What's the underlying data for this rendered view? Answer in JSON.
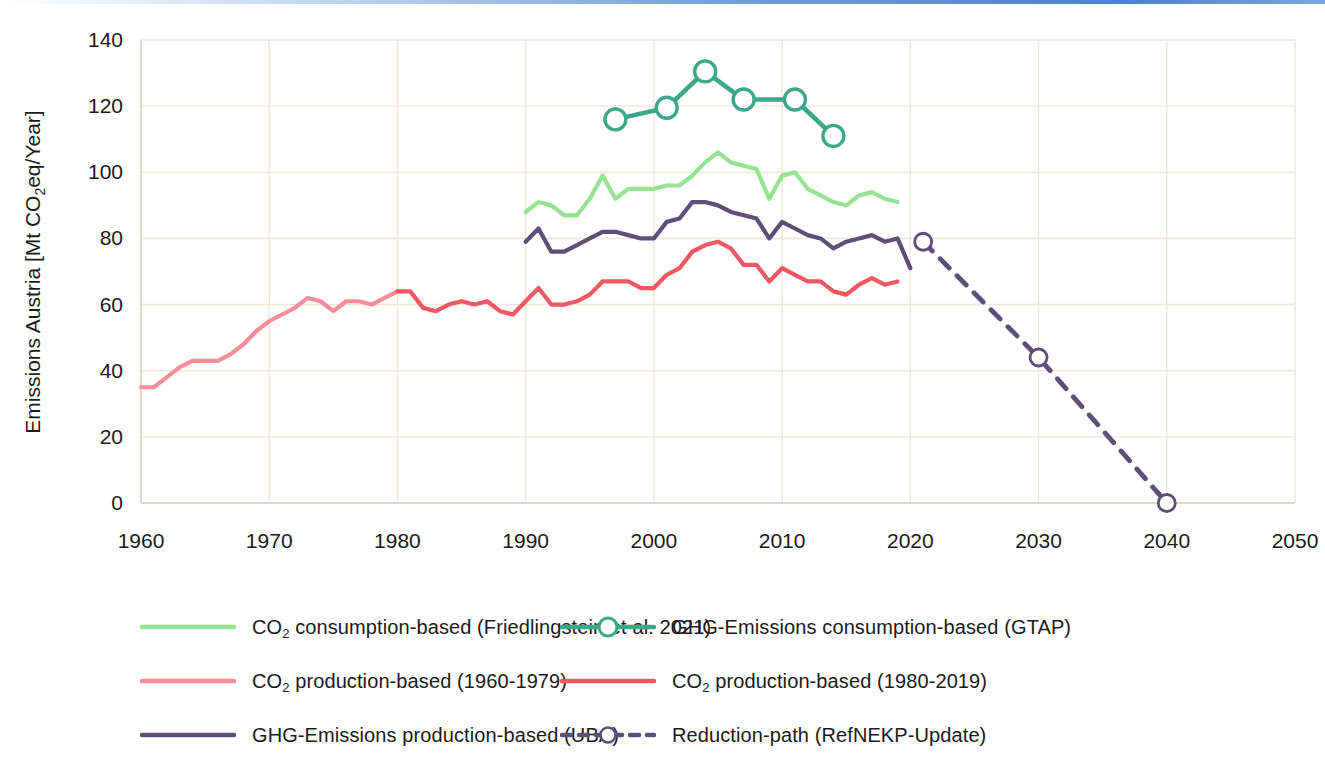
{
  "chart_data": {
    "type": "line",
    "title": "",
    "xlabel": "",
    "ylabel": "Emissions Austria [Mt CO2eq/Year]",
    "ylabel_parts": {
      "pre": "Emissions Austria [Mt CO",
      "sub": "2",
      "post": "eq/Year]"
    },
    "xlim": [
      1960,
      2050
    ],
    "ylim": [
      0,
      140
    ],
    "xticks": [
      "1960",
      "1970",
      "1980",
      "1990",
      "2000",
      "2010",
      "2020",
      "2030",
      "2040",
      "2050"
    ],
    "yticks": [
      "0",
      "20",
      "40",
      "60",
      "80",
      "100",
      "120",
      "140"
    ],
    "grid": true,
    "legend_position": "below-chart",
    "colors": {
      "co2_consumption_friedlingstein": "#95e391",
      "ghg_consumption_gtap": "#3ba888",
      "co2_production_1960_1979": "#f78d98",
      "co2_production_1980_2019": "#ef5761",
      "ghg_production_uba": "#5d4f77",
      "reduction_path": "#5d4f77",
      "gridline": "#efe7dd",
      "axis": "#d8cfc5"
    },
    "series": [
      {
        "name": "CO2 consumption-based (Friedlingstein et al. 2021)",
        "key": "co2_consumption_friedlingstein",
        "color": "#95e391",
        "style": "solid",
        "marker": "none",
        "x": [
          1990,
          1991,
          1992,
          1993,
          1994,
          1995,
          1996,
          1997,
          1998,
          1999,
          2000,
          2001,
          2002,
          2003,
          2004,
          2005,
          2006,
          2007,
          2008,
          2009,
          2010,
          2011,
          2012,
          2013,
          2014,
          2015,
          2016,
          2017,
          2018,
          2019
        ],
        "values": [
          88,
          91,
          90,
          87,
          87,
          92,
          99,
          92,
          95,
          95,
          95,
          96,
          96,
          99,
          103,
          106,
          103,
          102,
          101,
          92,
          99,
          100,
          95,
          93,
          91,
          90,
          93,
          94,
          92,
          91
        ]
      },
      {
        "name": "GHG-Emissions consumption-based (GTAP)",
        "key": "ghg_consumption_gtap",
        "color": "#3ba888",
        "style": "solid",
        "marker": "circle",
        "x": [
          1997,
          2001,
          2004,
          2007,
          2011,
          2014
        ],
        "values": [
          116,
          119.5,
          130.5,
          122,
          122,
          111
        ]
      },
      {
        "name": "CO2 production-based (1960-1979)",
        "key": "co2_production_1960_1979",
        "color": "#f78d98",
        "style": "solid",
        "marker": "none",
        "x": [
          1960,
          1961,
          1962,
          1963,
          1964,
          1965,
          1966,
          1967,
          1968,
          1969,
          1970,
          1971,
          1972,
          1973,
          1974,
          1975,
          1976,
          1977,
          1978,
          1979,
          1980
        ],
        "values": [
          35,
          35,
          38,
          41,
          43,
          43,
          43,
          45,
          48,
          52,
          55,
          57,
          59,
          62,
          61,
          58,
          61,
          61,
          60,
          62,
          64
        ]
      },
      {
        "name": "CO2 production-based (1980-2019)",
        "key": "co2_production_1980_2019",
        "color": "#ef5761",
        "style": "solid",
        "marker": "none",
        "x": [
          1980,
          1981,
          1982,
          1983,
          1984,
          1985,
          1986,
          1987,
          1988,
          1989,
          1990,
          1991,
          1992,
          1993,
          1994,
          1995,
          1996,
          1997,
          1998,
          1999,
          2000,
          2001,
          2002,
          2003,
          2004,
          2005,
          2006,
          2007,
          2008,
          2009,
          2010,
          2011,
          2012,
          2013,
          2014,
          2015,
          2016,
          2017,
          2018,
          2019
        ],
        "values": [
          64,
          64,
          59,
          58,
          60,
          61,
          60,
          61,
          58,
          57,
          61,
          65,
          60,
          60,
          61,
          63,
          67,
          67,
          67,
          65,
          65,
          69,
          71,
          76,
          78,
          79,
          77,
          72,
          72,
          67,
          71,
          69,
          67,
          67,
          64,
          63,
          66,
          68,
          66,
          67
        ]
      },
      {
        "name": "GHG-Emissions production-based (UBA)",
        "key": "ghg_production_uba",
        "color": "#5d4f77",
        "style": "solid",
        "marker": "none",
        "x": [
          1990,
          1991,
          1992,
          1993,
          1994,
          1995,
          1996,
          1997,
          1998,
          1999,
          2000,
          2001,
          2002,
          2003,
          2004,
          2005,
          2006,
          2007,
          2008,
          2009,
          2010,
          2011,
          2012,
          2013,
          2014,
          2015,
          2016,
          2017,
          2018,
          2019,
          2020
        ],
        "values": [
          79,
          83,
          76,
          76,
          78,
          80,
          82,
          82,
          81,
          80,
          80,
          85,
          86,
          91,
          91,
          90,
          88,
          87,
          86,
          80,
          85,
          83,
          81,
          80,
          77,
          79,
          80,
          81,
          79,
          80,
          71
        ]
      },
      {
        "name": "Reduction-path (RefNEKP-Update)",
        "key": "reduction_path",
        "color": "#5d4f77",
        "style": "dashed",
        "marker": "circle-open",
        "x": [
          2021,
          2030,
          2040
        ],
        "values": [
          79,
          44,
          0
        ]
      }
    ]
  },
  "legend": {
    "rows": [
      {
        "left": {
          "key": "co2_consumption_friedlingstein",
          "pre": "CO",
          "sub": "2",
          "post": " consumption-based (Friedlingstein et al. 2021)",
          "style": "solid",
          "marker": "none",
          "color": "#95e391"
        },
        "right": {
          "key": "ghg_consumption_gtap",
          "pre": "",
          "sub": "",
          "post": "GHG-Emissions consumption-based (GTAP)",
          "style": "solid",
          "marker": "circle",
          "color": "#3ba888"
        }
      },
      {
        "left": {
          "key": "co2_production_1960_1979",
          "pre": "CO",
          "sub": "2",
          "post": " production-based (1960-1979)",
          "style": "solid",
          "marker": "none",
          "color": "#f78d98"
        },
        "right": {
          "key": "co2_production_1980_2019",
          "pre": "CO",
          "sub": "2",
          "post": " production-based (1980-2019)",
          "style": "solid",
          "marker": "none",
          "color": "#ef5761"
        }
      },
      {
        "left": {
          "key": "ghg_production_uba",
          "pre": "",
          "sub": "",
          "post": "GHG-Emissions production-based  (UBA)",
          "style": "solid",
          "marker": "none",
          "color": "#5d4f77"
        },
        "right": {
          "key": "reduction_path",
          "pre": "",
          "sub": "",
          "post": "Reduction-path (RefNEKP-Update)",
          "style": "dashed",
          "marker": "circle-open",
          "color": "#5d4f77"
        }
      }
    ]
  }
}
